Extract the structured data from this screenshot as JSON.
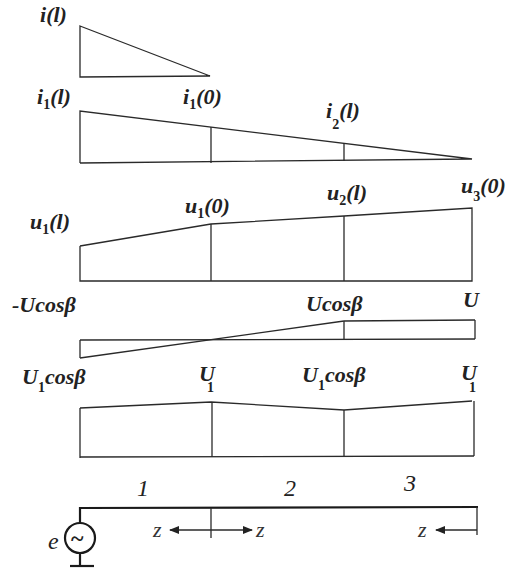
{
  "diagram": {
    "rows": [
      {
        "id": "i-single",
        "labels": [
          {
            "main": "i",
            "sub": "",
            "arg": "(l)"
          }
        ]
      },
      {
        "id": "i-distribution",
        "labels": [
          {
            "main": "i",
            "sub": "1",
            "arg": "(l)"
          },
          {
            "main": "i",
            "sub": "1",
            "arg": "(0)"
          },
          {
            "main": "i",
            "sub": "2",
            "arg": "(l)"
          }
        ]
      },
      {
        "id": "u-distribution",
        "labels": [
          {
            "main": "u",
            "sub": "1",
            "arg": "(l)"
          },
          {
            "main": "u",
            "sub": "1",
            "arg": "(0)"
          },
          {
            "main": "u",
            "sub": "2",
            "arg": "(l)"
          },
          {
            "main": "u",
            "sub": "3",
            "arg": "(0)"
          }
        ]
      },
      {
        "id": "U-cos-distribution",
        "labels": [
          {
            "text": "-Ucosβ"
          },
          {
            "text": "Ucosβ"
          },
          {
            "text": "U"
          }
        ]
      },
      {
        "id": "U1-distribution",
        "labels": [
          {
            "main": "U",
            "sub": "1",
            "rest": "cosβ"
          },
          {
            "main": "U",
            "sub": "1",
            "rest": ""
          },
          {
            "main": "U",
            "sub": "1",
            "rest": "cosβ"
          },
          {
            "main": "U",
            "sub": "1",
            "rest": ""
          }
        ]
      }
    ],
    "circuit": {
      "segments": [
        "1",
        "2",
        "3"
      ],
      "source_label": "e",
      "source_symbol": "~",
      "coordinate_label": "z"
    }
  }
}
